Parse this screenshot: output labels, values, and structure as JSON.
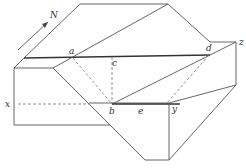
{
  "diagram": {
    "type": "block-diagram",
    "north_label": "N",
    "points": {
      "a": "a",
      "b": "b",
      "c": "c",
      "d": "d",
      "e": "e",
      "x": "x",
      "y": "y",
      "z": "z"
    }
  }
}
